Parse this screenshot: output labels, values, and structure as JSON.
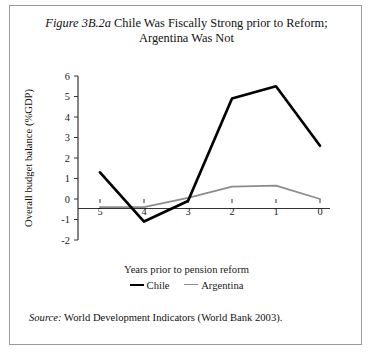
{
  "figure": {
    "number": "Figure 3B.2a",
    "title_rest": "Chile Was Fiscally Strong prior to Reform;",
    "title_line2": "Argentina Was Not",
    "source_label": "Source:",
    "source_text": "World Development Indicators (World Bank 2003)."
  },
  "colors": {
    "chile": "#000000",
    "argentina": "#8c8c8c",
    "axis": "#333333",
    "frame": "#9a9a9a",
    "background": "#ffffff"
  },
  "legend": {
    "items": [
      {
        "label": "Chile",
        "color": "#000000"
      },
      {
        "label": "Argentina",
        "color": "#8c8c8c"
      }
    ]
  },
  "chart_data": {
    "type": "line",
    "title": "Figure 3B.2a Chile Was Fiscally Strong prior to Reform; Argentina Was Not",
    "xlabel": "Years prior to pension reform",
    "ylabel": "Overall budget balance (%GDP)",
    "x": [
      5,
      4,
      3,
      2,
      1,
      0
    ],
    "xtick_labels": [
      "5",
      "4",
      "3",
      "2",
      "1",
      "0"
    ],
    "ytick_labels": [
      "6",
      "5",
      "4",
      "3",
      "2",
      "1",
      "0",
      "-1",
      "-2"
    ],
    "yticks": [
      6,
      5,
      4,
      3,
      2,
      1,
      0,
      -1,
      -2
    ],
    "ylim": [
      -2,
      6
    ],
    "xlim_reversed": true,
    "grid": false,
    "zero_line": true,
    "legend_position": "bottom-center",
    "series": [
      {
        "name": "Chile",
        "color": "#000000",
        "values": [
          1.3,
          -1.1,
          -0.1,
          4.9,
          5.5,
          2.6
        ]
      },
      {
        "name": "Argentina",
        "color": "#8c8c8c",
        "values": [
          -0.4,
          -0.4,
          0.05,
          0.6,
          0.65,
          0.0
        ]
      }
    ]
  }
}
